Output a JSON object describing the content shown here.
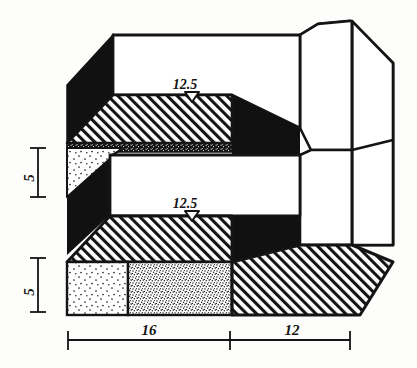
{
  "drawing": {
    "title": "Axonometric section of two-level slab structure",
    "ink_color": "#141414",
    "paper_color": "#fdfdfb",
    "fill_black": "#111111"
  },
  "level_markers": [
    {
      "name": "upper-level-marker",
      "label": "12.5",
      "symbol": "down-triangle"
    },
    {
      "name": "lower-level-marker",
      "label": "12.5",
      "symbol": "down-triangle"
    }
  ],
  "vertical_dimensions": [
    {
      "name": "upper-height",
      "label": "5"
    },
    {
      "name": "lower-height",
      "label": "5"
    }
  ],
  "horizontal_dimensions": [
    {
      "name": "left-span",
      "label": "16"
    },
    {
      "name": "right-span",
      "label": "12"
    }
  ],
  "hatch_regions": [
    {
      "name": "upper-slab-hatch",
      "pattern": "diagonal-hatch"
    },
    {
      "name": "lower-slab-hatch",
      "pattern": "diagonal-hatch"
    },
    {
      "name": "right-base-hatch",
      "pattern": "diagonal-hatch"
    }
  ],
  "stipple_regions": [
    {
      "name": "upper-fill-sparse",
      "pattern": "sparse-stipple"
    },
    {
      "name": "base-fill-sparse",
      "pattern": "sparse-stipple"
    },
    {
      "name": "base-fill-dense",
      "pattern": "dense-stipple"
    }
  ],
  "solid_regions": [
    {
      "name": "upper-left-shadow-wall",
      "pattern": "solid-black"
    },
    {
      "name": "mid-left-shadow-wall",
      "pattern": "solid-black"
    },
    {
      "name": "upper-right-shadow-wall",
      "pattern": "solid-black"
    },
    {
      "name": "lower-right-shadow-wall",
      "pattern": "solid-black"
    },
    {
      "name": "speckle-band",
      "pattern": "speckled-band"
    }
  ]
}
